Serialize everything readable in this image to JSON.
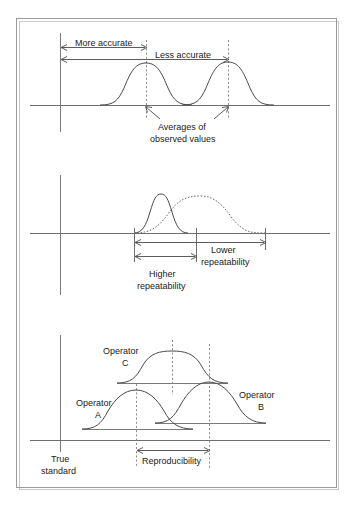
{
  "figure": {
    "type": "diagram",
    "panels": [
      {
        "id": "panel-accuracy",
        "labels": {
          "more_accurate": "More accurate",
          "less_accurate": "Less  accurate",
          "averages_line1": "Averages of",
          "averages_line2": "observed values"
        },
        "curves": [
          {
            "name": "accurate-distribution",
            "center_x": 146,
            "peak_y": 63,
            "half_width": 40
          },
          {
            "name": "less-accurate-distribution",
            "center_x": 228,
            "peak_y": 62,
            "half_width": 40
          }
        ],
        "markers": [
          {
            "name": "average-marker-left",
            "x": 146
          },
          {
            "name": "average-marker-right",
            "x": 228
          }
        ],
        "baseline_y": 105,
        "reference_x": 60
      },
      {
        "id": "panel-repeatability",
        "labels": {
          "higher_line1": "Higher",
          "higher_line2": "repeatability",
          "lower_line1": "Lower",
          "lower_line2": "repeatability"
        },
        "curves": [
          {
            "name": "higher-repeatability-distribution",
            "style": "solid",
            "center_x": 161,
            "peak_y": 194,
            "half_width": 26
          },
          {
            "name": "lower-repeatability-distribution",
            "style": "dotted",
            "center_x": 205,
            "peak_y": 196,
            "half_width": 49
          }
        ],
        "markers": [
          {
            "name": "repeatability-marker-left",
            "x": 134
          },
          {
            "name": "repeatability-marker-middle",
            "x": 196
          },
          {
            "name": "repeatability-marker-right",
            "x": 265
          }
        ],
        "baseline_y": 233
      },
      {
        "id": "panel-reproducibility",
        "labels": {
          "operator_c_line1": "Operator",
          "operator_c_line2": "C",
          "operator_a_line1": "Operator",
          "operator_a_line2": "A",
          "operator_b_line1": "Operator",
          "operator_b_line2": "B",
          "reproducibility": "Reproducibility",
          "true_standard_line1": "True",
          "true_standard_line2": "standard"
        },
        "curves": [
          {
            "name": "operator-c-distribution",
            "center_x": 172,
            "peak_y": 351,
            "baseline_y": 383,
            "half_width": 36
          },
          {
            "name": "operator-a-distribution",
            "center_x": 136,
            "peak_y": 390,
            "baseline_y": 429,
            "half_width": 36
          },
          {
            "name": "operator-b-distribution",
            "center_x": 209,
            "peak_y": 382,
            "baseline_y": 423,
            "half_width": 36
          }
        ],
        "markers": [
          {
            "name": "reproducibility-marker-left",
            "x": 136
          },
          {
            "name": "reproducibility-marker-right",
            "x": 209
          },
          {
            "name": "operator-c-center-marker",
            "x": 172
          }
        ],
        "baseline_y": 440,
        "reference_x": 60
      }
    ]
  },
  "colors": {
    "curve_stroke": "#4a4a4a",
    "axis_stroke": "#6e6e6e",
    "dash_stroke": "#8a8a8a",
    "frame_stroke": "#9a9a9a",
    "text": "#1a1a1a",
    "background": "#ffffff"
  },
  "text": {
    "more_accurate": "More accurate",
    "less_accurate": "Less  accurate",
    "averages_of": "Averages of",
    "observed_values": "observed values",
    "higher": "Higher",
    "higher_repeatability": "repeatability",
    "lower": "Lower",
    "lower_repeatability": "repeatability",
    "operator_word": "Operator",
    "operator_c_letter": "C",
    "operator_a_letter": "A",
    "operator_b_letter": "B",
    "reproducibility": "Reproducibility",
    "true": "True",
    "standard": "standard"
  }
}
